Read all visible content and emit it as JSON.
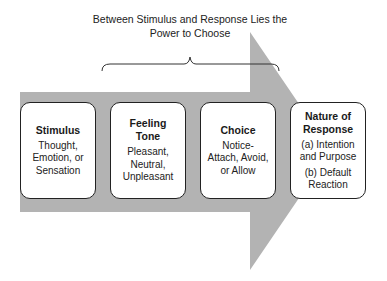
{
  "caption": {
    "line1": "Between Stimulus and Response Lies the",
    "line2": "Power to Choose"
  },
  "colors": {
    "arrow": "#b3b3b3",
    "box_fill": "#ffffff",
    "box_border": "#222222",
    "text": "#1a1a1a"
  },
  "boxes": [
    {
      "title_lines": [
        "Stimulus"
      ],
      "body_lines": [
        "Thought,",
        "Emotion, or",
        "Sensation"
      ]
    },
    {
      "title_lines": [
        "Feeling",
        "Tone"
      ],
      "body_lines": [
        "Pleasant,",
        "Neutral,",
        "Unpleasant"
      ]
    },
    {
      "title_lines": [
        "Choice"
      ],
      "body_lines": [
        "Notice-",
        "Attach, Avoid,",
        "or Allow"
      ]
    },
    {
      "title_lines": [
        "Nature of",
        "Response"
      ],
      "body_lines": [
        "(a) Intention",
        "and Purpose",
        "(b) Default",
        "Reaction"
      ]
    }
  ]
}
